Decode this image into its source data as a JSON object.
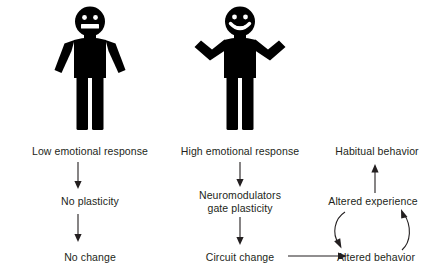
{
  "diagram": {
    "text_color": "#231f20",
    "figure_color": "#000000",
    "background": "#ffffff"
  },
  "figures": [
    {
      "id": "low-emotion-figure",
      "icon": "person-neutral-arms-down-icon",
      "expression": "neutral",
      "pose": "arms-down"
    },
    {
      "id": "high-emotion-figure",
      "icon": "person-smiling-arms-raised-icon",
      "expression": "smiling",
      "pose": "arms-shrug"
    }
  ],
  "columns": {
    "low": {
      "step1": "Low emotional response",
      "step2": "No plasticity",
      "step3": "No change"
    },
    "high": {
      "step1": "High emotional response",
      "step2": "Neuromodulators\ngate plasticity",
      "step3": "Circuit change"
    },
    "outcome": {
      "step1": "Habitual behavior",
      "step2": "Altered experience",
      "step3": "Altered behavior"
    }
  },
  "arrows": [
    {
      "id": "low-1-to-2",
      "kind": "straight-down",
      "from": "Low emotional response",
      "to": "No plasticity"
    },
    {
      "id": "low-2-to-3",
      "kind": "straight-down",
      "from": "No plasticity",
      "to": "No change"
    },
    {
      "id": "high-1-to-2",
      "kind": "straight-down",
      "from": "High emotional response",
      "to": "Neuromodulators gate plasticity"
    },
    {
      "id": "high-2-to-3",
      "kind": "straight-down",
      "from": "Neuromodulators gate plasticity",
      "to": "Circuit change"
    },
    {
      "id": "circuit-to-behavior",
      "kind": "straight-right",
      "from": "Circuit change",
      "to": "Altered behavior"
    },
    {
      "id": "experience-to-habitual",
      "kind": "straight-up",
      "from": "Altered experience",
      "to": "Habitual behavior"
    },
    {
      "id": "experience-to-behavior",
      "kind": "curve-down-left",
      "from": "Altered experience",
      "to": "Altered behavior"
    },
    {
      "id": "behavior-to-experience",
      "kind": "curve-up-right",
      "from": "Altered behavior",
      "to": "Altered experience"
    }
  ]
}
